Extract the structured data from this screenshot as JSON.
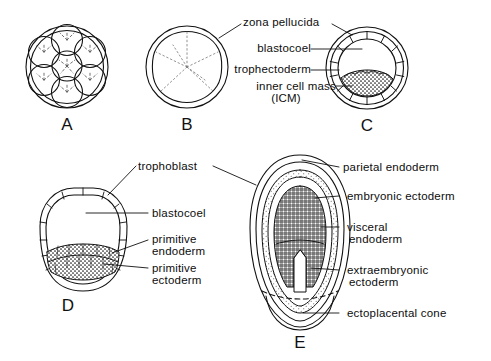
{
  "figure": {
    "background_color": "#ffffff",
    "line_color": "#111111",
    "text_color": "#0d0d0d"
  },
  "panels": [
    {
      "id": "A",
      "letter": "A",
      "name": "morula",
      "description": "Cleavage-stage morula with individual blastomeres inside zona pellucida"
    },
    {
      "id": "B",
      "letter": "B",
      "name": "compacted-morula",
      "description": "Compacted morula inside zona pellucida"
    },
    {
      "id": "C",
      "letter": "C",
      "name": "blastocyst",
      "description": "Blastocyst with blastocoel, trophectoderm and inner cell mass"
    },
    {
      "id": "D",
      "letter": "D",
      "name": "implanting-blastocyst",
      "description": "Hatched blastocyst with trophoblast, primitive endoderm and primitive ectoderm"
    },
    {
      "id": "E",
      "letter": "E",
      "name": "egg-cylinder",
      "description": "Egg cylinder stage embryo with parietal and visceral endoderm, embryonic and extraembryonic ectoderm, ectoplacental cone"
    }
  ],
  "labels": {
    "zona_pellucida": "zona pellucida",
    "blastocoel": "blastocoel",
    "trophectoderm": "trophectoderm",
    "inner_cell_mass_line1": "inner cell mass",
    "inner_cell_mass_line2": "(ICM)",
    "trophoblast": "trophoblast",
    "blastocoel_d": "blastocoel",
    "primitive_endoderm_line1": "primitive",
    "primitive_endoderm_line2": "endoderm",
    "primitive_ectoderm_line1": "primitive",
    "primitive_ectoderm_line2": "ectoderm",
    "parietal_endoderm": "parietal endoderm",
    "embryonic_ectoderm": "embryonic ectoderm",
    "visceral_endoderm_line1": "visceral",
    "visceral_endoderm_line2": "endoderm",
    "extraembryonic_ectoderm_line1": "extraembryonic",
    "extraembryonic_ectoderm_line2": "ectoderm",
    "ectoplacental_cone": "ectoplacental cone"
  }
}
